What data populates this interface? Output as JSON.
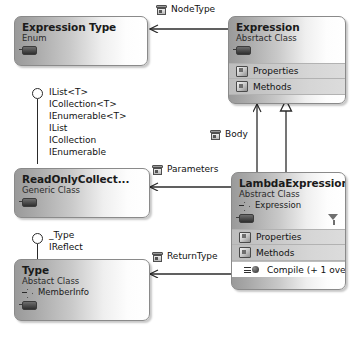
{
  "diagram": {
    "kind": "uml-class-diagram",
    "background": "#ffffff",
    "border_color": "#8a8a8a",
    "text_color": "#111111",
    "band_color": "#cccccc"
  },
  "classes": {
    "expression_type": {
      "name": "Expression Type",
      "stereotype": "Enum"
    },
    "expression": {
      "name": "Expression",
      "stereotype": "Absrtact Class",
      "compartments": [
        {
          "label": "Properties",
          "icon": "folder-icon",
          "style": "band"
        },
        {
          "label": "Methods",
          "icon": "folder-icon",
          "style": "band"
        }
      ]
    },
    "read_only_collection": {
      "name": "ReadOnlyCollect...",
      "stereotype": "Generic Class"
    },
    "lambda_expression": {
      "name": "LambdaExpression",
      "stereotype": "Abstract Class",
      "base": "Expression",
      "compartments": [
        {
          "label": "Properties",
          "icon": "folder-icon",
          "style": "band"
        },
        {
          "label": "Methods",
          "icon": "folder-icon",
          "style": "band"
        },
        {
          "label": "Compile (+ 1 ove...",
          "icon": "method-icon",
          "style": "plain"
        }
      ]
    },
    "type": {
      "name": "Type",
      "stereotype": "Abstact Class",
      "base": "MemberInfo"
    }
  },
  "associations": [
    {
      "label": "NodeType",
      "icon": "property-box-icon",
      "from": "expression",
      "to": "expression_type"
    },
    {
      "label": "Body",
      "icon": "property-box-icon",
      "from": "lambda_expression",
      "to": "expression"
    },
    {
      "label": "Parameters",
      "icon": "property-box-icon",
      "from": "lambda_expression",
      "to": "read_only_collection"
    },
    {
      "label": "ReturnType",
      "icon": "property-box-icon",
      "from": "lambda_expression",
      "to": "type"
    }
  ],
  "generalizations": [
    {
      "from": "lambda_expression",
      "to": "expression",
      "arrow": "hollow-triangle"
    }
  ],
  "interfaces": {
    "read_only_collection": [
      "IList<T>",
      "ICollection<T>",
      "IEnumerable<T>",
      "IList",
      "ICollection",
      "IEnumerable"
    ],
    "type": [
      "_Type",
      "IReflect"
    ]
  }
}
